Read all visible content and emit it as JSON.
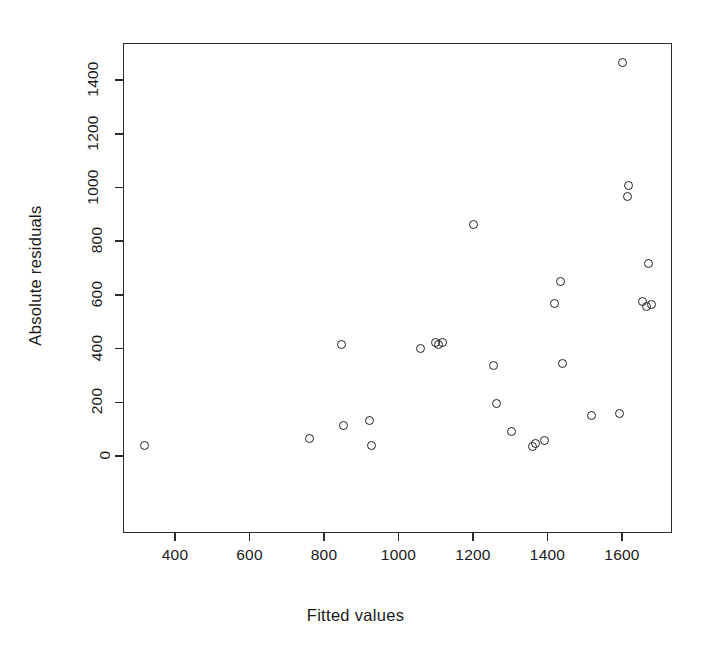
{
  "chart_data": {
    "type": "scatter",
    "title": "",
    "xlabel": "Fitted values",
    "ylabel": "Absolute residuals",
    "xlim": [
      290,
      1730
    ],
    "ylim": [
      -30,
      1530
    ],
    "xticks": [
      400,
      600,
      800,
      1000,
      1200,
      1400,
      1600
    ],
    "yticks": [
      0,
      200,
      400,
      600,
      800,
      1000,
      1200,
      1400
    ],
    "xticklabels": [
      "400",
      "600",
      "800",
      "1000",
      "1200",
      "1400",
      "1600"
    ],
    "yticklabels": [
      "0",
      "200",
      "400",
      "600",
      "800",
      "1000",
      "1200",
      "1400"
    ],
    "grid": false,
    "legend": null,
    "marker": "open-circle",
    "marker_color": "#222222",
    "n_points": 29,
    "points": [
      {
        "x": 317,
        "y": 40
      },
      {
        "x": 760,
        "y": 67
      },
      {
        "x": 848,
        "y": 415
      },
      {
        "x": 851,
        "y": 114
      },
      {
        "x": 921,
        "y": 134
      },
      {
        "x": 928,
        "y": 39
      },
      {
        "x": 1060,
        "y": 399
      },
      {
        "x": 1108,
        "y": 417
      },
      {
        "x": 1117,
        "y": 424
      },
      {
        "x": 1201,
        "y": 861
      },
      {
        "x": 1255,
        "y": 336
      },
      {
        "x": 1264,
        "y": 194
      },
      {
        "x": 1302,
        "y": 90
      },
      {
        "x": 1359,
        "y": 37
      },
      {
        "x": 1369,
        "y": 48
      },
      {
        "x": 1392,
        "y": 57
      },
      {
        "x": 1420,
        "y": 567
      },
      {
        "x": 1434,
        "y": 651
      },
      {
        "x": 1440,
        "y": 344
      },
      {
        "x": 1519,
        "y": 149
      },
      {
        "x": 1592,
        "y": 160
      },
      {
        "x": 1601,
        "y": 1465
      },
      {
        "x": 1615,
        "y": 968
      },
      {
        "x": 1617,
        "y": 1006
      },
      {
        "x": 1656,
        "y": 577
      },
      {
        "x": 1665,
        "y": 555
      },
      {
        "x": 1671,
        "y": 717
      },
      {
        "x": 1678,
        "y": 565
      },
      {
        "x": 1100,
        "y": 421
      }
    ]
  },
  "figure": {
    "background_color": "#ffffff",
    "axis_color": "#2b2b2b",
    "text_color": "#1a1a1a"
  }
}
